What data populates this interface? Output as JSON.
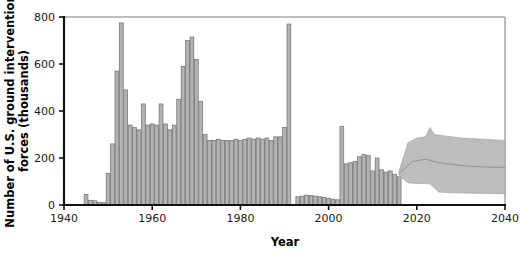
{
  "chart_data": {
    "type": "bar",
    "title": "",
    "xlabel": "Year",
    "ylabel": "Number of U.S. ground intervention forces (thousands)",
    "xlim": [
      1940,
      2040
    ],
    "ylim": [
      0,
      800
    ],
    "xticks": [
      1940,
      1960,
      1980,
      2000,
      2020,
      2040
    ],
    "yticks": [
      0,
      200,
      400,
      600,
      800
    ],
    "grid": false,
    "legend": null,
    "bar_color": "#b3b3b3",
    "bar_edge_color": "#6e6e6e",
    "band_color": "#bdbdbd",
    "series": [
      {
        "name": "U.S. ground intervention forces",
        "x": [
          1945,
          1946,
          1947,
          1948,
          1949,
          1950,
          1951,
          1952,
          1953,
          1954,
          1955,
          1956,
          1957,
          1958,
          1959,
          1960,
          1961,
          1962,
          1963,
          1964,
          1965,
          1966,
          1967,
          1968,
          1969,
          1970,
          1971,
          1972,
          1973,
          1974,
          1975,
          1976,
          1977,
          1978,
          1979,
          1980,
          1981,
          1982,
          1983,
          1984,
          1985,
          1986,
          1987,
          1988,
          1989,
          1990,
          1991,
          1993,
          1994,
          1995,
          1996,
          1997,
          1998,
          1999,
          2000,
          2001,
          2002,
          2003,
          2004,
          2005,
          2006,
          2007,
          2008,
          2009,
          2010,
          2011,
          2012,
          2013,
          2014,
          2015,
          2016
        ],
        "values": [
          45,
          20,
          18,
          12,
          10,
          135,
          260,
          570,
          775,
          490,
          340,
          330,
          320,
          430,
          340,
          345,
          340,
          430,
          345,
          320,
          340,
          450,
          590,
          700,
          715,
          620,
          440,
          300,
          275,
          275,
          280,
          275,
          275,
          275,
          280,
          275,
          280,
          285,
          280,
          285,
          280,
          285,
          275,
          290,
          290,
          330,
          770,
          35,
          38,
          42,
          40,
          38,
          35,
          32,
          28,
          25,
          22,
          335,
          175,
          180,
          185,
          205,
          215,
          210,
          145,
          200,
          150,
          140,
          145,
          130,
          120
        ]
      }
    ],
    "projection": {
      "name": "Projected range",
      "start_year": 2016,
      "end_year": 2040,
      "upper": [
        {
          "year": 2016,
          "value": 145
        },
        {
          "year": 2018,
          "value": 265
        },
        {
          "year": 2020,
          "value": 285
        },
        {
          "year": 2022,
          "value": 290
        },
        {
          "year": 2023,
          "value": 330
        },
        {
          "year": 2024,
          "value": 300
        },
        {
          "year": 2026,
          "value": 295
        },
        {
          "year": 2030,
          "value": 285
        },
        {
          "year": 2035,
          "value": 280
        },
        {
          "year": 2040,
          "value": 275
        }
      ],
      "lower": [
        {
          "year": 2016,
          "value": 125
        },
        {
          "year": 2018,
          "value": 95
        },
        {
          "year": 2020,
          "value": 92
        },
        {
          "year": 2023,
          "value": 90
        },
        {
          "year": 2025,
          "value": 55
        },
        {
          "year": 2028,
          "value": 52
        },
        {
          "year": 2033,
          "value": 50
        },
        {
          "year": 2040,
          "value": 48
        }
      ],
      "median": [
        {
          "year": 2016,
          "value": 135
        },
        {
          "year": 2019,
          "value": 185
        },
        {
          "year": 2022,
          "value": 195
        },
        {
          "year": 2025,
          "value": 180
        },
        {
          "year": 2030,
          "value": 168
        },
        {
          "year": 2035,
          "value": 162
        },
        {
          "year": 2040,
          "value": 160
        }
      ]
    }
  }
}
